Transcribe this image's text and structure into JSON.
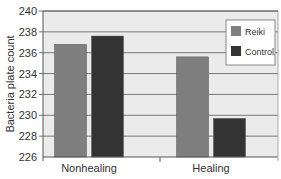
{
  "chart_data": {
    "type": "bar",
    "title": "",
    "xlabel": "",
    "ylabel": "Bacteria plate count",
    "ylim": [
      226,
      240
    ],
    "yticks": [
      226,
      228,
      230,
      232,
      234,
      236,
      238,
      240
    ],
    "grid": true,
    "legend_position": "upper right, inside plot",
    "categories": [
      "Nonhealing",
      "Healing"
    ],
    "series": [
      {
        "name": "Reiki",
        "color": "#7f7f7f",
        "values": [
          236.8,
          235.6
        ]
      },
      {
        "name": "Control",
        "color": "#333333",
        "values": [
          237.6,
          229.7
        ]
      }
    ]
  },
  "colors": {
    "plot_background": "#ebebeb",
    "gridline": "#777777",
    "axis": "#555555"
  }
}
